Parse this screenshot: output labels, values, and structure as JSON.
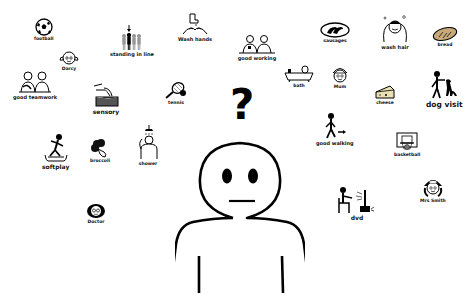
{
  "symbols": {
    "football": {
      "label": "football"
    },
    "darcy": {
      "label": "Darcy"
    },
    "standing_in_line": {
      "label": "standing in line"
    },
    "wash_hands": {
      "label": "Wash hands"
    },
    "good_working": {
      "label": "good working"
    },
    "sausages": {
      "label": "sausages"
    },
    "wash_hair": {
      "label": "wash hair"
    },
    "bread": {
      "label": "bread"
    },
    "good_teamwork": {
      "label": "good teamwork"
    },
    "sensory": {
      "label": "sensory"
    },
    "tennis": {
      "label": "tennis"
    },
    "bath": {
      "label": "bath"
    },
    "mum": {
      "label": "Mum"
    },
    "cheese": {
      "label": "cheese"
    },
    "dog_visit": {
      "label": "dog visit"
    },
    "good_walking": {
      "label": "good walking"
    },
    "softplay": {
      "label": "softplay"
    },
    "broccoli": {
      "label": "broccoli"
    },
    "shower": {
      "label": "shower"
    },
    "basketball": {
      "label": "basketball"
    },
    "dvd": {
      "label": "dvd"
    },
    "mrs_smith": {
      "label": "Mrs Smith"
    },
    "doctor": {
      "label": "Doctor"
    }
  },
  "center": {
    "question_mark": "?"
  },
  "colors": {
    "ink": "#000000",
    "background": "#ffffff",
    "grey_figure": "#9a9a9a",
    "bread": "#c9a878",
    "cheese": "#e8e0b0"
  }
}
